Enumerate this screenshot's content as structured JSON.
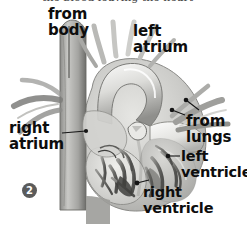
{
  "figure": {
    "title_partial": "the blood leaving the heart",
    "step_marker": "2",
    "palette": {
      "background": "#ffffff",
      "label_text": "#0d0d0d",
      "leader_line": "#1a1a1a",
      "marker_fill": "#5b5b5b",
      "marker_text": "#ffffff",
      "tissue_light": "#e8e8e6",
      "tissue_mid": "#b5b5b2",
      "tissue_dark": "#7a7a78",
      "tissue_shadow": "#4a4a48",
      "chamber_fill": "#cfcfcc",
      "highlight": "#f6f6f4"
    },
    "labels": [
      {
        "id": "from-body",
        "line1": "from",
        "line2": "body",
        "x": 48,
        "y": 6
      },
      {
        "id": "left-atrium",
        "line1": "left",
        "line2": "atrium",
        "x": 133,
        "y": 23
      },
      {
        "id": "right-atrium",
        "line1": "right",
        "line2": "atrium",
        "x": 9,
        "y": 120
      },
      {
        "id": "from-lungs",
        "line1": "from",
        "line2": "lungs",
        "x": 186,
        "y": 113
      },
      {
        "id": "left-ventricle",
        "line1": "left",
        "line2": "ventricle",
        "x": 181,
        "y": 148
      },
      {
        "id": "right-ventricle",
        "line1": "right",
        "line2": "ventricle",
        "x": 143,
        "y": 184
      }
    ],
    "leaders": [
      {
        "id": "right-atrium-leader",
        "x1": 62,
        "y1": 133,
        "x2": 86,
        "y2": 131,
        "dot_x": 86,
        "dot_y": 131
      },
      {
        "id": "from-lungs-leader-a",
        "x1": 196,
        "y1": 109,
        "x2": 186,
        "y2": 100,
        "dot_x": 186,
        "dot_y": 100
      },
      {
        "id": "from-lungs-leader-b",
        "x1": 183,
        "y1": 114,
        "x2": 172,
        "y2": 110,
        "dot_x": 172,
        "dot_y": 110
      },
      {
        "id": "left-ventricle-leader",
        "x1": 179,
        "y1": 156,
        "x2": 168,
        "y2": 156,
        "dot_x": 168,
        "dot_y": 156
      },
      {
        "id": "right-ventricle-leader",
        "x1": 148,
        "y1": 180,
        "x2": 137,
        "y2": 183,
        "dot_x": 137,
        "dot_y": 183
      }
    ],
    "marker": {
      "x": 22,
      "y": 183,
      "label": "2"
    }
  }
}
